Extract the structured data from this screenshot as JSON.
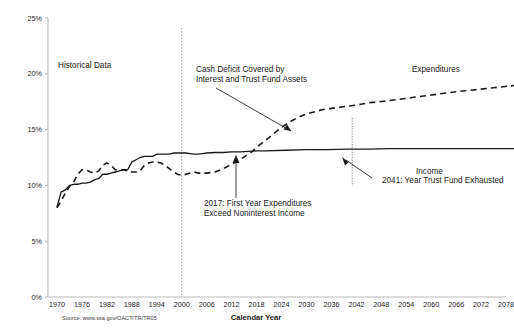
{
  "chart_data": {
    "type": "line",
    "title": "",
    "xlabel": "Calendar Year",
    "ylabel": "",
    "xlim": [
      1970,
      2080
    ],
    "ylim": [
      0,
      25
    ],
    "grid": false,
    "legend_position": "inline-labels",
    "x_ticks": [
      "1970",
      "1976",
      "1982",
      "1988",
      "1994",
      "2000",
      "2006",
      "2012",
      "2018",
      "2024",
      "2030",
      "2036",
      "2042",
      "2048",
      "2054",
      "2060",
      "2066",
      "2072",
      "2078"
    ],
    "y_ticks": [
      "0%",
      "5%",
      "10%",
      "15%",
      "20%",
      "25%"
    ],
    "series": [
      {
        "name": "Income",
        "style": "solid",
        "x": [
          1970,
          1971,
          1972,
          1973,
          1974,
          1975,
          1976,
          1977,
          1978,
          1979,
          1980,
          1981,
          1982,
          1983,
          1984,
          1985,
          1986,
          1987,
          1988,
          1989,
          1990,
          1991,
          1992,
          1993,
          1994,
          1995,
          1996,
          1997,
          1998,
          1999,
          2000,
          2001,
          2002,
          2003,
          2004,
          2005,
          2006,
          2008,
          2010,
          2012,
          2014,
          2016,
          2018,
          2020,
          2025,
          2030,
          2035,
          2040,
          2045,
          2050,
          2055,
          2060,
          2065,
          2070,
          2075,
          2080
        ],
        "y": [
          8.1,
          9.4,
          9.6,
          10.0,
          10.1,
          10.1,
          10.2,
          10.2,
          10.3,
          10.5,
          10.6,
          11.0,
          11.0,
          11.1,
          11.2,
          11.3,
          11.4,
          11.4,
          12.1,
          12.3,
          12.5,
          12.6,
          12.6,
          12.6,
          12.8,
          12.8,
          12.8,
          12.8,
          12.9,
          12.9,
          12.9,
          12.9,
          12.85,
          12.8,
          12.8,
          12.85,
          12.9,
          12.95,
          12.95,
          13.0,
          13.0,
          13.05,
          13.1,
          13.1,
          13.15,
          13.2,
          13.2,
          13.25,
          13.25,
          13.3,
          13.3,
          13.3,
          13.3,
          13.3,
          13.3,
          13.3
        ]
      },
      {
        "name": "Expenditures",
        "style": "dashed",
        "x": [
          1970,
          1971,
          1972,
          1973,
          1974,
          1975,
          1976,
          1977,
          1978,
          1979,
          1980,
          1981,
          1982,
          1983,
          1984,
          1985,
          1986,
          1987,
          1988,
          1989,
          1990,
          1991,
          1992,
          1993,
          1994,
          1995,
          1996,
          1997,
          1998,
          1999,
          2000,
          2001,
          2002,
          2003,
          2004,
          2005,
          2006,
          2008,
          2010,
          2012,
          2014,
          2016,
          2017,
          2018,
          2020,
          2022,
          2024,
          2026,
          2028,
          2030,
          2032,
          2034,
          2036,
          2038,
          2040,
          2042,
          2045,
          2050,
          2055,
          2060,
          2065,
          2070,
          2075,
          2080
        ],
        "y": [
          8.0,
          8.6,
          9.3,
          9.9,
          10.3,
          11.0,
          11.4,
          11.4,
          11.2,
          11.1,
          11.3,
          11.8,
          12.0,
          11.8,
          11.4,
          11.4,
          11.4,
          11.3,
          11.2,
          11.2,
          11.3,
          11.8,
          12.0,
          12.1,
          12.1,
          12.0,
          11.8,
          11.5,
          11.2,
          11.0,
          10.9,
          11.0,
          11.1,
          11.2,
          11.1,
          11.1,
          11.1,
          11.2,
          11.5,
          11.9,
          12.3,
          12.8,
          13.05,
          13.4,
          14.0,
          14.6,
          15.2,
          15.7,
          16.1,
          16.4,
          16.6,
          16.8,
          16.9,
          17.0,
          17.1,
          17.2,
          17.4,
          17.6,
          17.85,
          18.1,
          18.35,
          18.55,
          18.75,
          18.95
        ]
      }
    ],
    "annotations": [
      {
        "id": "historical-data",
        "text": "Historical Data",
        "x_px": 58,
        "y_px": 68
      },
      {
        "id": "cash-deficit",
        "line1": "Cash Deficit Covered by",
        "line2": "Interest and Trust Fund Assets",
        "x_px": 196,
        "y_px": 72
      },
      {
        "id": "first-year-expenditures",
        "line1": "2017: First Year Expenditures",
        "line2": "Exceed Noninterest Income",
        "x_px": 204,
        "y_px": 206
      },
      {
        "id": "trust-fund-exhausted",
        "text": "2041: Year Trust Fund Exhausted",
        "x_px": 382,
        "y_px": 183
      },
      {
        "id": "expenditures-label",
        "text": "Expenditures",
        "x_px": 412,
        "y_px": 72
      },
      {
        "id": "income-label",
        "text": "Income",
        "x_px": 416,
        "y_px": 174
      }
    ],
    "markers": [
      {
        "id": "historical-projection-divider",
        "year": 2005
      },
      {
        "id": "trust-fund-exhausted-marker",
        "year": 2041
      }
    ]
  },
  "footer": {
    "source": "Source: www.ssa.gov/OACT/TR/TR05"
  },
  "colors": {
    "series": "#1a1a1a",
    "axis": "#b9b9b9",
    "background": "#ffffff",
    "divider": "#888888"
  }
}
